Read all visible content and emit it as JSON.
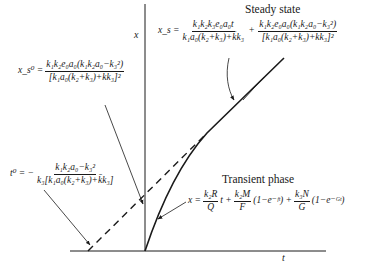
{
  "axes": {
    "y_label": "x",
    "x_label": "t"
  },
  "regions": {
    "steady_state": "Steady state",
    "transient_phase": "Transient phase"
  },
  "equations": {
    "steady_state": {
      "lhs": "x_s =",
      "term1_num": "k₁k₂k₃e₀a₀t",
      "term1_den": "k₁a₀(k₂+k₃)+k̄k₃",
      "plus": "+",
      "term2_num": "k₁k₂e₀a₀(k₁k₂a₀−k₃²)",
      "term2_den": "[k₁a₀(k₂+k₃)+k̄k₃]²"
    },
    "intercept_x": {
      "lhs": "x_s⁰ =",
      "num": "k₁k₂e₀a₀(k₁k₂a₀−k₃²)",
      "den": "[k₁a₀(k₂+k₃)+k̄k₃]²"
    },
    "intercept_t": {
      "lhs": "t⁰ = −",
      "num": "k₁k₂a₀−k₃²",
      "den": "k₃[k₁a₀(k₂+k₃)+k̄k₃]"
    },
    "transient": {
      "lhs": "x =",
      "t1_num": "k₂R",
      "t1_den": "Q",
      "t1_tail": "t +",
      "t2_num": "k₂M",
      "t2_den": "F",
      "t2_tail": "(1−e⁻ᶠᵗ) +",
      "t3_num": "k₃N",
      "t3_den": "G",
      "t3_tail": "(1−e⁻ᴳᵗ)"
    }
  },
  "colors": {
    "ink": "#1a1a1a",
    "background": "#ffffff"
  }
}
